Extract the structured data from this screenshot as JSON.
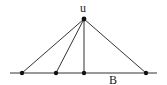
{
  "diagram": {
    "apex": {
      "label": "u",
      "x": 84,
      "y": 19
    },
    "baseline": {
      "label": "B",
      "x1": 10,
      "x2": 157,
      "y": 73
    },
    "base_points": [
      {
        "x": 22,
        "y": 73
      },
      {
        "x": 56,
        "y": 73
      },
      {
        "x": 84,
        "y": 73
      },
      {
        "x": 146,
        "y": 73
      }
    ],
    "colors": {
      "line": "#333333",
      "point": "#111111"
    }
  }
}
